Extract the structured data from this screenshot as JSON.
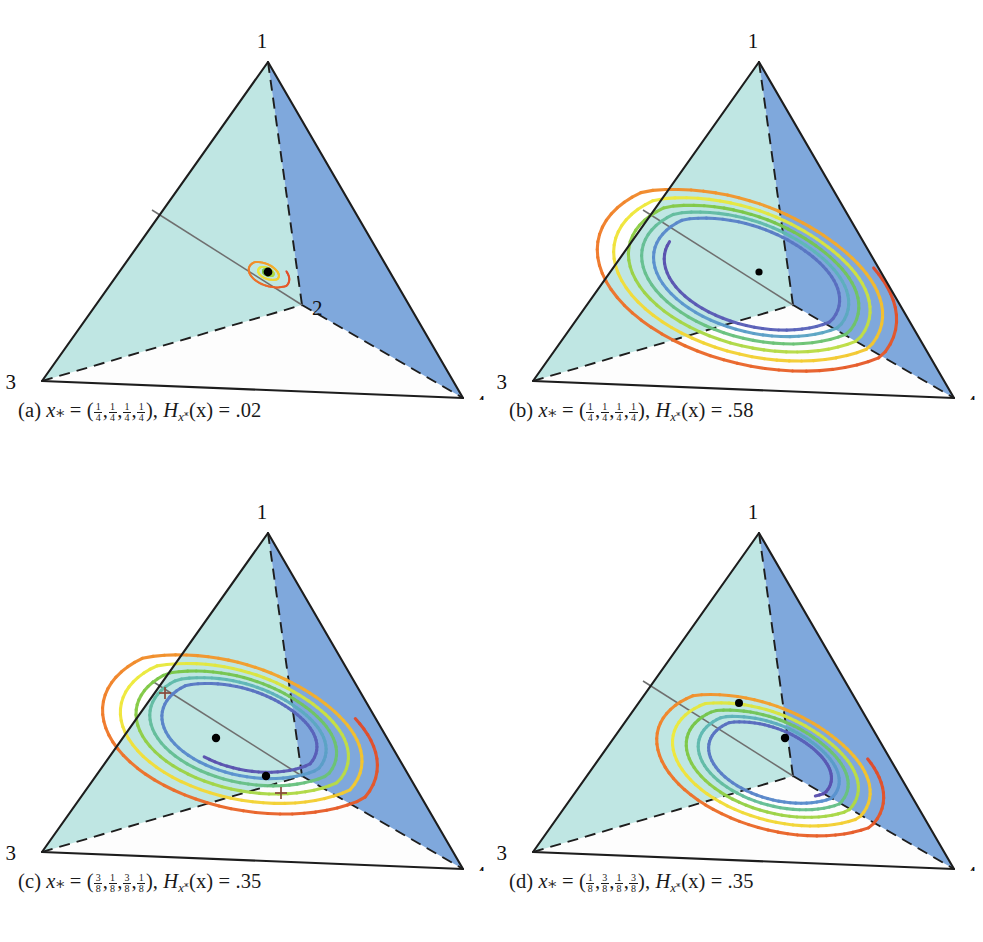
{
  "figure": {
    "background": "#ffffff",
    "panel_count": 4
  },
  "geometry": {
    "vertices": {
      "v1": {
        "label": "1",
        "x": 268,
        "y": 62
      },
      "v2": {
        "label": "2",
        "x": 302,
        "y": 305
      },
      "v3": {
        "label": "3",
        "x": 42,
        "y": 381
      },
      "v4": {
        "label": "4",
        "x": 463,
        "y": 398
      }
    },
    "label_offsets": {
      "v1": {
        "dx": -6,
        "dy": -14
      },
      "v2": {
        "dx": 10,
        "dy": 10
      },
      "v3": {
        "dx": -26,
        "dy": 8
      },
      "v4": {
        "dx": 12,
        "dy": 12
      }
    }
  },
  "colors": {
    "face_left": "#bfe6e3",
    "face_right": "#7fa8dc",
    "face_bottom": "#fdfdfd",
    "edge_solid": "#1d1d1d",
    "edge_dashed": "#1d1d1d",
    "invariant_line": "#6f6f6f",
    "fixed_point": "#000000",
    "spiral_start": "#e8502a",
    "spiral_mid_warm": "#f2e53c",
    "spiral_mid_cool": "#7ec64a",
    "spiral_end": "#5a4fae"
  },
  "panels": [
    {
      "id": "a",
      "data_name": "panel-a",
      "caption": {
        "index": "(a)",
        "var": "x",
        "fractions": [
          "1/4",
          "1/4",
          "1/4",
          "1/4"
        ],
        "entropy_symbol": "H",
        "entropy_arg": "(x)",
        "entropy_value": ".02",
        "plain": "(a) x* = (1/4,1/4,1/4,1/4), Hx*(x) = .02"
      },
      "spiral": {
        "center_x": 268,
        "center_y": 272,
        "radius_x": 24,
        "radius_y": 25,
        "turns": 5.2,
        "shrink": 0.8,
        "rotation": -18,
        "loop_count": 9,
        "tilt": 0.52,
        "description": "tiny tight rainbow spiral converging to interior fixed point"
      },
      "fixed_points": [
        {
          "x": 268,
          "y": 272,
          "r": 4.4
        }
      ],
      "invariant_line": {
        "x1": 152,
        "y1": 210,
        "x2": 302,
        "y2": 305
      },
      "vertex_labels_shown": [
        "1",
        "2",
        "3",
        "4"
      ]
    },
    {
      "id": "b",
      "data_name": "panel-b",
      "caption": {
        "index": "(b)",
        "var": "x",
        "fractions": [
          "1/4",
          "1/4",
          "1/4",
          "1/4"
        ],
        "entropy_symbol": "H",
        "entropy_arg": "(x)",
        "entropy_value": ".58",
        "plain": "(b) x* = (1/4,1/4,1/4,1/4), Hx*(x) = .58"
      },
      "spiral": {
        "center_x": 268,
        "center_y": 272,
        "radius_x": 150,
        "radius_y": 140,
        "turns": 5.6,
        "shrink": 0.965,
        "rotation": -18,
        "loop_count": 13,
        "tilt": 0.52,
        "description": "large rainbow spiral filling the tetrahedron, converging inward"
      },
      "fixed_points": [
        {
          "x": 268,
          "y": 272,
          "r": 3.6
        }
      ],
      "invariant_line": {
        "x1": 152,
        "y1": 210,
        "x2": 302,
        "y2": 305
      },
      "vertex_labels_shown": [
        "1",
        "3",
        "4"
      ]
    },
    {
      "id": "c",
      "data_name": "panel-c",
      "caption": {
        "index": "(c)",
        "var": "x",
        "fractions": [
          "3/8",
          "1/8",
          "3/8",
          "1/8"
        ],
        "entropy_symbol": "H",
        "entropy_arg": "(x)",
        "entropy_value": ".35",
        "plain": "(c) x* = (3/8,1/8,3/8,1/8), Hx*(x) = .35"
      },
      "spiral": {
        "center_x": 250,
        "center_y": 255,
        "radius_x": 138,
        "radius_y": 132,
        "turns": 5.4,
        "shrink": 0.958,
        "rotation": -20,
        "loop_count": 13,
        "tilt": 0.5,
        "description": "large rainbow spiral, shifted toward vertex 3 side"
      },
      "fixed_points": [
        {
          "x": 216,
          "y": 267,
          "r": 4.2
        },
        {
          "x": 266,
          "y": 305,
          "r": 4.2
        }
      ],
      "invariant_line": {
        "x1": 152,
        "y1": 210,
        "x2": 302,
        "y2": 305
      },
      "cross_marks": [
        {
          "x": 165,
          "y": 222
        },
        {
          "x": 281,
          "y": 322
        }
      ],
      "vertex_labels_shown": [
        "1",
        "3",
        "4"
      ]
    },
    {
      "id": "d",
      "data_name": "panel-d",
      "caption": {
        "index": "(d)",
        "var": "x",
        "fractions": [
          "1/8",
          "3/8",
          "1/8",
          "3/8"
        ],
        "entropy_symbol": "H",
        "entropy_arg": "(x)",
        "entropy_value": ".35",
        "plain": "(d) x* = (1/8,3/8,1/8,3/8), Hx*(x) = .35"
      },
      "spiral": {
        "center_x": 288,
        "center_y": 288,
        "radius_x": 116,
        "radius_y": 112,
        "turns": 5.2,
        "shrink": 0.955,
        "rotation": -16,
        "loop_count": 12,
        "tilt": 0.5,
        "description": "medium rainbow spiral shifted toward vertices 2 and 4"
      },
      "fixed_points": [
        {
          "x": 248,
          "y": 232,
          "r": 4.0
        },
        {
          "x": 294,
          "y": 267,
          "r": 4.2
        }
      ],
      "invariant_line": {
        "x1": 152,
        "y1": 210,
        "x2": 302,
        "y2": 305
      },
      "vertex_labels_shown": [
        "1",
        "3",
        "4"
      ]
    }
  ],
  "chart_data": {
    "type": "line",
    "xlabel": "",
    "ylabel": "",
    "legend_position": "none",
    "grid": false,
    "series": [
      {
        "name": "(a) spiral",
        "entropy": 0.02,
        "x_star": [
          0.25,
          0.25,
          0.25,
          0.25
        ],
        "relative_amplitude": 0.06
      },
      {
        "name": "(b) spiral",
        "entropy": 0.58,
        "x_star": [
          0.25,
          0.25,
          0.25,
          0.25
        ],
        "relative_amplitude": 0.92
      },
      {
        "name": "(c) spiral",
        "entropy": 0.35,
        "x_star": [
          0.375,
          0.125,
          0.375,
          0.125
        ],
        "relative_amplitude": 0.84
      },
      {
        "name": "(d) spiral",
        "entropy": 0.35,
        "x_star": [
          0.125,
          0.375,
          0.125,
          0.375
        ],
        "relative_amplitude": 0.7
      }
    ],
    "categories": [
      "(a)",
      "(b)",
      "(c)",
      "(d)"
    ],
    "values": [
      0.02,
      0.58,
      0.35,
      0.35
    ]
  }
}
